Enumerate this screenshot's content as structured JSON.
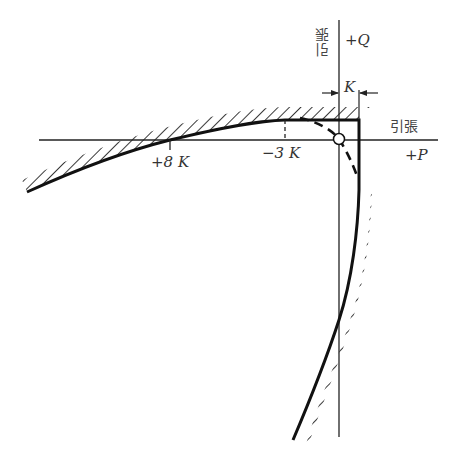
{
  "diagram": {
    "axes": {
      "horizontal": {
        "label_text": "引張",
        "label_symbol": "+P"
      },
      "vertical": {
        "label_text": "引張",
        "label_symbol": "+Q"
      }
    },
    "dimension": {
      "label": "K"
    },
    "ticks": [
      {
        "label": "+8 K",
        "x": 170
      },
      {
        "label": "−3 K",
        "x": 285
      }
    ],
    "origin_marker": "open-circle",
    "colors": {
      "line": "#111111",
      "text": "#333333",
      "background": "#ffffff"
    }
  }
}
